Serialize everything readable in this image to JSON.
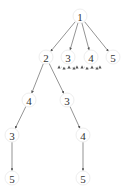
{
  "diagram": {
    "type": "search-tree",
    "nodes": [
      {
        "id": "n1",
        "label": "1",
        "x": 80,
        "y": 16
      },
      {
        "id": "n2",
        "label": "2",
        "x": 46,
        "y": 57
      },
      {
        "id": "n3",
        "label": "3",
        "x": 68,
        "y": 57
      },
      {
        "id": "n4",
        "label": "4",
        "x": 91,
        "y": 57
      },
      {
        "id": "n5",
        "label": "5",
        "x": 113,
        "y": 57
      },
      {
        "id": "n6",
        "label": "4",
        "x": 29,
        "y": 100
      },
      {
        "id": "n7",
        "label": "3",
        "x": 67,
        "y": 100
      },
      {
        "id": "n8",
        "label": "3",
        "x": 12,
        "y": 135
      },
      {
        "id": "n9",
        "label": "4",
        "x": 83,
        "y": 135
      },
      {
        "id": "n10",
        "label": "5",
        "x": 12,
        "y": 178
      },
      {
        "id": "n11",
        "label": "5",
        "x": 83,
        "y": 178
      }
    ],
    "edges": [
      {
        "from": "n1",
        "to": "n2"
      },
      {
        "from": "n1",
        "to": "n3"
      },
      {
        "from": "n1",
        "to": "n4"
      },
      {
        "from": "n1",
        "to": "n5"
      },
      {
        "from": "n2",
        "to": "n6"
      },
      {
        "from": "n2",
        "to": "n7"
      },
      {
        "from": "n6",
        "to": "n8"
      },
      {
        "from": "n7",
        "to": "n9"
      },
      {
        "from": "n8",
        "to": "n10"
      },
      {
        "from": "n9",
        "to": "n11"
      }
    ],
    "pruned_children_under": [
      "n3",
      "n4"
    ]
  }
}
